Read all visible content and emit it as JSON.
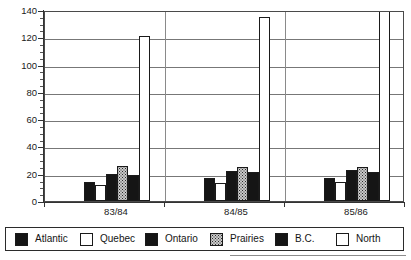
{
  "chart_data": {
    "type": "bar",
    "title": "",
    "subtitle": "",
    "xlabel": "",
    "ylabel": "",
    "categories": [
      "83/84",
      "84/85",
      "85/86"
    ],
    "series": [
      {
        "name": "Atlantic",
        "values": [
          14,
          17,
          17
        ],
        "swatch": "black"
      },
      {
        "name": "Quebec",
        "values": [
          12,
          13,
          14
        ],
        "swatch": "white"
      },
      {
        "name": "Ontario",
        "values": [
          20,
          22,
          23
        ],
        "swatch": "black"
      },
      {
        "name": "Prairies",
        "values": [
          26,
          25,
          25
        ],
        "swatch": "dotted-gray"
      },
      {
        "name": "B.C.",
        "values": [
          19,
          21,
          21
        ],
        "swatch": "black"
      },
      {
        "name": "North",
        "values": [
          121,
          135,
          143
        ],
        "swatch": "white"
      }
    ],
    "ylim": [
      0,
      140
    ],
    "yticks": [
      0,
      20,
      40,
      60,
      80,
      100,
      120,
      140
    ],
    "ytick_labels": [
      "0",
      "20",
      "40",
      "60",
      "80",
      "100",
      "120",
      "140"
    ],
    "minor_ticks": true,
    "grid": "horizontal",
    "legend_position": "bottom"
  },
  "legend": {
    "items": [
      {
        "label": "Atlantic"
      },
      {
        "label": "Quebec"
      },
      {
        "label": "Ontario"
      },
      {
        "label": "Prairies"
      },
      {
        "label": "B.C."
      },
      {
        "label": "North"
      }
    ]
  },
  "colors": {
    "solid": "#151515",
    "white": "#ffffff",
    "dotted": "#c9c9c9",
    "axis": "#333333",
    "grid": "#777777",
    "border": "#2b2b2b"
  }
}
